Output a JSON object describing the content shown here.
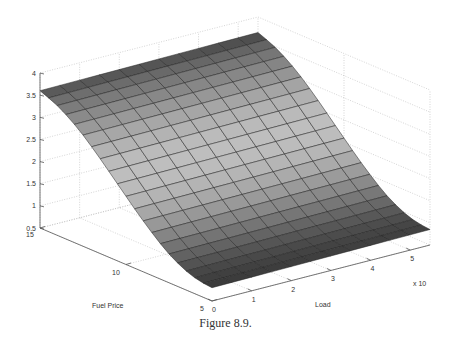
{
  "figure": {
    "caption": "Figure 8.9."
  },
  "chart_data": {
    "type": "surface",
    "title": "",
    "caption": "Figure 8.9.",
    "xlabel": "Load",
    "ylabel": "Fuel Price",
    "zlabel": "",
    "x_multiplier_label": "x 10",
    "xlim": [
      0,
      5.5
    ],
    "ylim": [
      5,
      15
    ],
    "zlim": [
      0.5,
      4
    ],
    "x_ticks": [
      0,
      1,
      2,
      3,
      4,
      5
    ],
    "y_ticks": [
      5,
      10,
      15
    ],
    "z_ticks": [
      0.5,
      1,
      1.5,
      2,
      2.5,
      3,
      3.5,
      4
    ],
    "z_tick_labels": [
      "0.5",
      "1",
      "1.5",
      "2",
      "2.5",
      "3",
      "3.5",
      "4"
    ],
    "grid": true,
    "colormap": "gray",
    "x_grid": [
      0,
      0.5,
      1,
      1.5,
      2,
      2.5,
      3,
      3.5,
      4,
      4.5,
      5,
      5.5
    ],
    "y_grid": [
      5,
      5.5,
      6,
      6.5,
      7,
      7.5,
      8,
      8.5,
      9,
      9.5,
      10,
      10.5,
      11,
      11.5,
      12,
      12.5,
      13,
      13.5,
      14,
      14.5,
      15
    ],
    "z_at_load0_by_fuel": [
      0.8,
      0.82,
      0.86,
      0.93,
      1.03,
      1.15,
      1.3,
      1.47,
      1.65,
      1.84,
      2.04,
      2.24,
      2.44,
      2.64,
      2.83,
      3.01,
      3.17,
      3.31,
      3.43,
      3.52,
      3.6
    ],
    "z_at_loadmax_by_fuel": [
      0.85,
      0.87,
      0.91,
      0.98,
      1.08,
      1.2,
      1.35,
      1.52,
      1.7,
      1.89,
      2.09,
      2.29,
      2.49,
      2.69,
      2.88,
      3.06,
      3.22,
      3.36,
      3.48,
      3.57,
      3.65
    ]
  }
}
